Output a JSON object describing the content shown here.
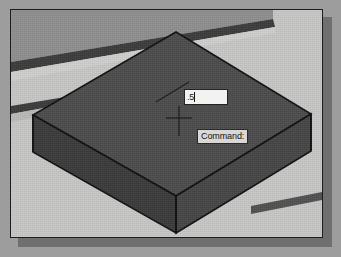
{
  "window": {
    "app": "cad-viewport",
    "background_color": "#c7c7c5",
    "border_color": "#1d1d1d",
    "shadow_color": "#6f6f6f"
  },
  "viewport": {
    "name": "isometric-model-space",
    "model": {
      "shape": "extruded-square-plate",
      "projection": "isometric",
      "top_face_color": "#4c4c4c",
      "left_face_color": "#3f3f3f",
      "right_face_color": "#454545",
      "edge_color": "#111111"
    },
    "background_lines": {
      "name": "ucs-grid-bands",
      "color": "#3c3c3c"
    }
  },
  "dynamic_input": {
    "name": "dynamic-input-field",
    "value": ".5",
    "placeholder": "",
    "has_caret": true
  },
  "command_prompt": {
    "name": "command-tooltip",
    "text": "Command:"
  },
  "crosshair": {
    "name": "crosshair-cursor",
    "color": "#1a1a1a",
    "x": 178,
    "y": 117
  }
}
